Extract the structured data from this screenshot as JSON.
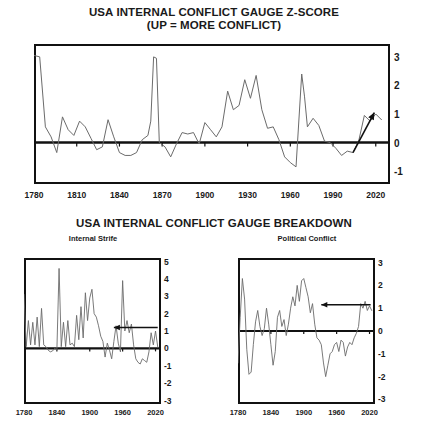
{
  "titles": {
    "main_line1": "USA INTERNAL CONFLICT GAUGE Z-SCORE",
    "main_line2": "(UP = MORE CONFLICT)",
    "breakdown": "USA INTERNAL CONFLICT GAUGE BREAKDOWN",
    "sub_left": "Internal Strife",
    "sub_right": "Political Conflict"
  },
  "colors": {
    "line": "#6b6b6b",
    "axis": "#111111",
    "background": "#ffffff",
    "annotation": "#111111"
  },
  "chart_data": [
    {
      "id": "usa-internal-conflict-zscore",
      "type": "line",
      "title": "USA INTERNAL CONFLICT GAUGE Z-SCORE (UP = MORE CONFLICT)",
      "xlabel": "",
      "ylabel": "",
      "xlim": [
        1780,
        2030
      ],
      "ylim": [
        -1.45,
        3.45
      ],
      "xticks": [
        1780,
        1810,
        1840,
        1870,
        1900,
        1930,
        1960,
        1990,
        2020
      ],
      "yticks": [
        3,
        2,
        1,
        0,
        -1
      ],
      "grid": false,
      "legend": "none",
      "zero_line": true,
      "annotations": [
        {
          "type": "arrow",
          "direction": "up-right",
          "x_from": 2004,
          "y_from": -0.35,
          "x_to": 2019,
          "y_to": 1.05
        }
      ],
      "x": [
        1780,
        1784,
        1788,
        1792,
        1796,
        1800,
        1804,
        1808,
        1812,
        1816,
        1820,
        1824,
        1828,
        1832,
        1836,
        1840,
        1844,
        1848,
        1852,
        1856,
        1860,
        1862,
        1864,
        1866,
        1868,
        1872,
        1876,
        1880,
        1884,
        1888,
        1892,
        1896,
        1900,
        1904,
        1908,
        1912,
        1916,
        1920,
        1924,
        1928,
        1932,
        1936,
        1940,
        1944,
        1948,
        1952,
        1956,
        1960,
        1964,
        1968,
        1970,
        1972,
        1976,
        1980,
        1984,
        1988,
        1992,
        1996,
        2000,
        2004,
        2008,
        2012,
        2016,
        2020,
        2024
      ],
      "values": [
        3.05,
        3.0,
        0.55,
        0.2,
        -0.35,
        0.9,
        0.45,
        0.25,
        0.75,
        0.55,
        0.15,
        -0.25,
        -0.15,
        0.8,
        0.2,
        -0.35,
        -0.45,
        -0.45,
        -0.35,
        0.1,
        0.25,
        0.75,
        3.0,
        2.95,
        0.0,
        -0.15,
        -0.5,
        -0.05,
        0.35,
        0.3,
        0.35,
        -0.05,
        0.7,
        0.45,
        0.2,
        0.55,
        1.8,
        1.15,
        1.3,
        2.2,
        1.55,
        2.35,
        1.15,
        0.5,
        0.55,
        0.1,
        -0.5,
        -0.7,
        -0.85,
        2.4,
        1.6,
        0.55,
        0.85,
        0.6,
        0.05,
        0.0,
        -0.2,
        -0.45,
        -0.3,
        -0.35,
        0.05,
        0.95,
        0.75,
        1.0,
        0.8
      ]
    },
    {
      "id": "internal-strife",
      "type": "line",
      "title": "Internal Strife",
      "xlabel": "",
      "ylabel": "",
      "xlim": [
        1780,
        2030
      ],
      "ylim": [
        -3.2,
        5.2
      ],
      "xticks": [
        1780,
        1840,
        1900,
        1960,
        2020
      ],
      "yticks": [
        5,
        4,
        3,
        2,
        1,
        0,
        -1,
        -2,
        -3
      ],
      "grid": false,
      "legend": "none",
      "zero_line": true,
      "annotations": [
        {
          "type": "arrow",
          "direction": "left",
          "x_from": 2024,
          "y_from": 1.2,
          "x_to": 1944,
          "y_to": 1.2
        }
      ],
      "x": [
        1780,
        1784,
        1788,
        1792,
        1796,
        1800,
        1804,
        1808,
        1812,
        1816,
        1820,
        1824,
        1828,
        1832,
        1836,
        1840,
        1844,
        1848,
        1852,
        1856,
        1860,
        1864,
        1868,
        1872,
        1876,
        1880,
        1884,
        1888,
        1892,
        1896,
        1900,
        1904,
        1908,
        1912,
        1916,
        1920,
        1924,
        1928,
        1932,
        1936,
        1940,
        1944,
        1948,
        1952,
        1956,
        1960,
        1964,
        1968,
        1972,
        1976,
        1980,
        1984,
        1988,
        1992,
        1996,
        2000,
        2004,
        2008,
        2012,
        2016,
        2020,
        2024
      ],
      "values": [
        3.1,
        0.1,
        1.6,
        0.2,
        1.5,
        0.2,
        1.8,
        0.1,
        2.3,
        0.2,
        0.1,
        -0.1,
        -0.2,
        -0.15,
        0.0,
        -0.1,
        4.6,
        0.1,
        1.5,
        0.1,
        1.6,
        0.2,
        0.3,
        0.1,
        1.9,
        0.5,
        2.4,
        0.6,
        3.2,
        1.6,
        2.9,
        3.4,
        2.0,
        1.8,
        1.3,
        0.7,
        0.4,
        -0.5,
        0.3,
        -0.1,
        -0.6,
        0.4,
        1.3,
        0.3,
        -0.2,
        3.9,
        1.0,
        1.6,
        0.9,
        1.4,
        0.2,
        -0.6,
        -0.8,
        -0.9,
        -0.6,
        -0.7,
        -0.8,
        -0.2,
        0.9,
        0.2,
        1.0,
        0.1
      ]
    },
    {
      "id": "political-conflict",
      "type": "line",
      "title": "Political Conflict",
      "xlabel": "",
      "ylabel": "",
      "xlim": [
        1780,
        2030
      ],
      "ylim": [
        -3.2,
        3.2
      ],
      "xticks": [
        1780,
        1840,
        1900,
        1960,
        2020
      ],
      "yticks": [
        3,
        2,
        1,
        0,
        -1,
        -2,
        -3
      ],
      "grid": false,
      "legend": "none",
      "zero_line": true,
      "annotations": [
        {
          "type": "arrow",
          "direction": "left",
          "x_from": 2022,
          "y_from": 1.15,
          "x_to": 1932,
          "y_to": 1.15
        }
      ],
      "x": [
        1780,
        1784,
        1788,
        1792,
        1796,
        1800,
        1804,
        1808,
        1812,
        1816,
        1820,
        1824,
        1828,
        1832,
        1836,
        1840,
        1844,
        1848,
        1852,
        1856,
        1860,
        1864,
        1868,
        1872,
        1876,
        1880,
        1884,
        1888,
        1892,
        1896,
        1900,
        1904,
        1908,
        1912,
        1916,
        1920,
        1924,
        1928,
        1932,
        1936,
        1940,
        1944,
        1948,
        1952,
        1956,
        1960,
        1964,
        1968,
        1972,
        1976,
        1980,
        1984,
        1988,
        1992,
        1996,
        2000,
        2004,
        2008,
        2012,
        2016,
        2020,
        2024
      ],
      "values": [
        -1.4,
        0.6,
        2.3,
        1.4,
        -0.8,
        -1.9,
        -1.8,
        -0.6,
        0.4,
        0.9,
        0.2,
        -0.2,
        0.1,
        1.0,
        0.3,
        -0.6,
        -1.5,
        -0.9,
        0.6,
        0.9,
        0.2,
        0.5,
        -0.2,
        0.3,
        1.0,
        1.5,
        1.1,
        2.0,
        1.3,
        2.2,
        2.3,
        1.9,
        1.5,
        0.8,
        1.2,
        0.3,
        -0.3,
        -0.4,
        -0.6,
        -1.4,
        -2.0,
        -1.5,
        -1.0,
        -0.9,
        -0.6,
        -0.5,
        -0.9,
        -0.4,
        -0.5,
        -1.1,
        -0.7,
        -0.5,
        -0.6,
        -0.3,
        -0.1,
        0.2,
        1.2,
        1.0,
        1.3,
        0.9,
        1.1,
        0.9
      ]
    }
  ]
}
